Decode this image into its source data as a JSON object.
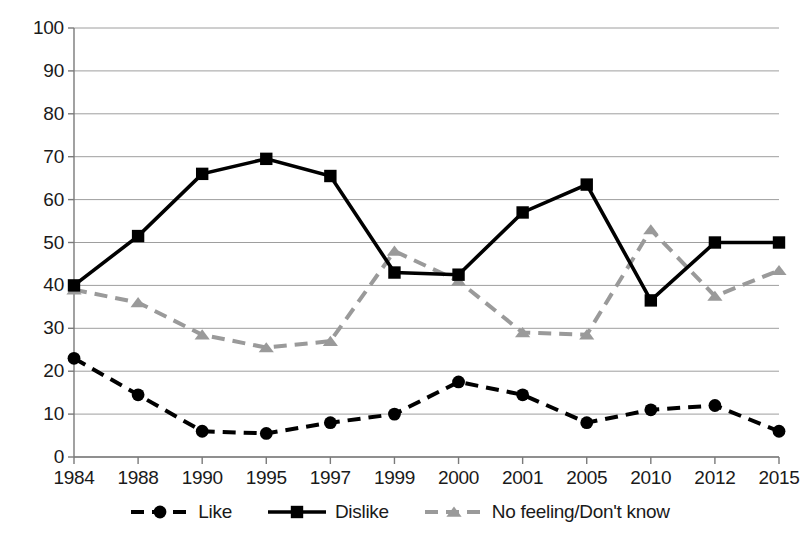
{
  "chart_data": {
    "type": "line",
    "title": "",
    "subtitle": "",
    "xlabel": "",
    "ylabel": "",
    "categories": [
      "1984",
      "1988",
      "1990",
      "1995",
      "1997",
      "1999",
      "2000",
      "2001",
      "2005",
      "2010",
      "2012",
      "2015"
    ],
    "ylim": [
      0,
      100
    ],
    "xlim_categories": true,
    "y_ticks": [
      "0",
      "10",
      "20",
      "30",
      "40",
      "50",
      "60",
      "70",
      "80",
      "90",
      "100"
    ],
    "y_tick_values": [
      0,
      10,
      20,
      30,
      40,
      50,
      60,
      70,
      80,
      90,
      100
    ],
    "grid": "horizontal",
    "legend_position": "bottom",
    "series": [
      {
        "name": "Like",
        "values": [
          23,
          14.5,
          6,
          5.5,
          8,
          10,
          17.5,
          14.5,
          8,
          11,
          12,
          6
        ],
        "color": "#000000",
        "line_style": "dashed",
        "marker": "circle"
      },
      {
        "name": "Dislike",
        "values": [
          40,
          51.5,
          66,
          69.5,
          65.5,
          43,
          42.5,
          57,
          63.5,
          36.5,
          50,
          50
        ],
        "color": "#000000",
        "line_style": "solid",
        "marker": "square"
      },
      {
        "name": "No feeling/Don't know",
        "values": [
          39,
          36,
          28.5,
          25.5,
          27,
          48,
          41,
          29,
          28.5,
          53,
          37.5,
          43.5
        ],
        "color": "#9a9a9a",
        "line_style": "dashed",
        "marker": "triangle"
      }
    ]
  },
  "legend": {
    "items": [
      {
        "label": "Like",
        "marker": "circle-marker",
        "style": "dashed"
      },
      {
        "label": "Dislike",
        "marker": "square-marker",
        "style": "solid"
      },
      {
        "label": "No feeling/Don't know",
        "marker": "triangle-marker",
        "style": "dashed"
      }
    ]
  },
  "colors": {
    "dark": "#000000",
    "gray": "#9a9a9a",
    "grid": "#9e9e9e",
    "axis": "#7a7a7a",
    "background": "#ffffff"
  }
}
